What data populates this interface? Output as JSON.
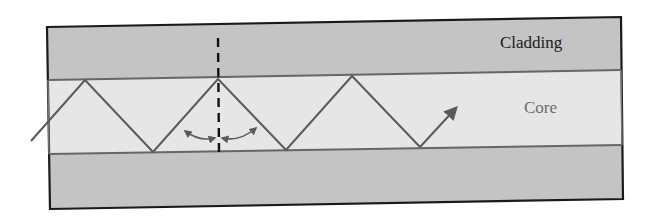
{
  "diagram": {
    "labels": {
      "cladding": "Cladding",
      "core": "Core"
    },
    "colors": {
      "cladding_fill": "#c4c4c4",
      "core_fill": "#e6e6e6",
      "border": "#1a1a1a",
      "interface": "#666666",
      "ray": "#5a5a5a",
      "normal": "#111111",
      "core_label": "#6b6b6b",
      "cladding_label": "#1a1a1a"
    },
    "elements": [
      "top-cladding-layer",
      "core-layer",
      "bottom-cladding-layer",
      "light-ray-zigzag",
      "normal-line-dashed",
      "angle-arc-arrows",
      "exit-arrow"
    ]
  }
}
